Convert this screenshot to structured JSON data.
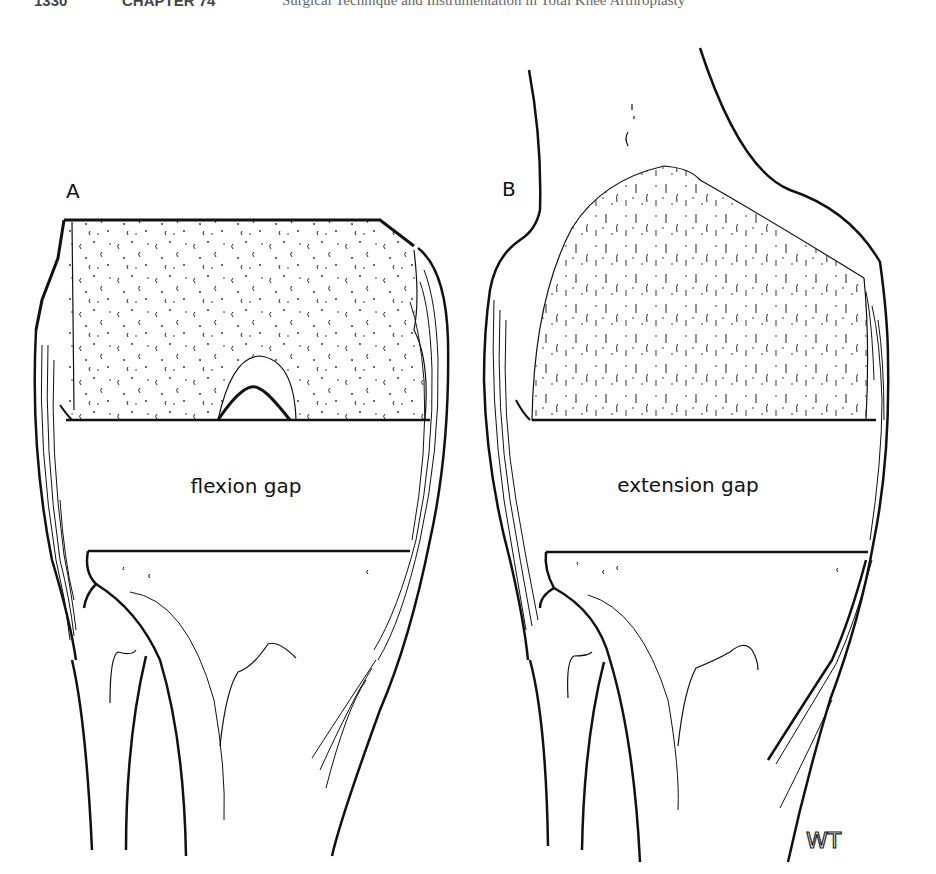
{
  "header": {
    "page_number": "1330",
    "chapter": "CHAPTER 74",
    "running_title": "Surgical Technique and Instrumentation in Total Knee Arthroplasty"
  },
  "figure": {
    "panels": [
      {
        "id": "A",
        "label": "A",
        "gap_label": "flexion gap"
      },
      {
        "id": "B",
        "label": "B",
        "gap_label": "extension gap"
      }
    ],
    "signature": "WT",
    "colors": {
      "ink": "#111111",
      "background": "#ffffff"
    }
  }
}
